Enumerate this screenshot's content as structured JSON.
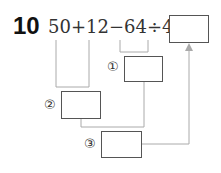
{
  "problem": {
    "number": "10",
    "expression": "50+12−64÷4=",
    "steps": [
      {
        "label": "①",
        "covers": "64÷4"
      },
      {
        "label": "②",
        "covers": "50+12"
      },
      {
        "label": "③",
        "covers": "②−①"
      }
    ]
  },
  "colors": {
    "line": "#aaaaaa",
    "box_border": "#555555",
    "text": "#333333"
  }
}
